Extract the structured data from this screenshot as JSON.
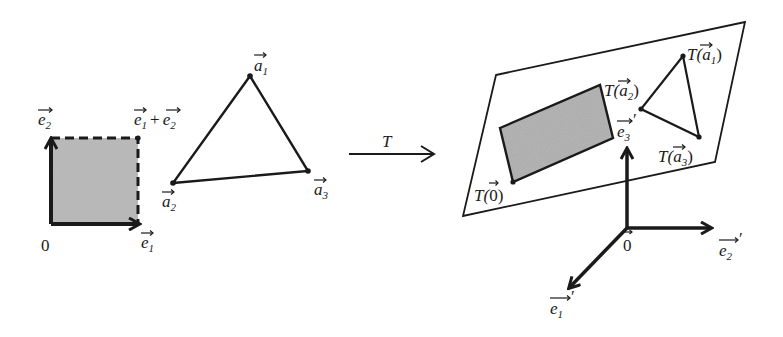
{
  "figure": {
    "left": {
      "square": {
        "origin_label": "0",
        "e1_label": "e",
        "e1_sub": "1",
        "e2_label": "e",
        "e2_sub": "2",
        "corner_label_a": "e",
        "corner_sub_a": "1",
        "corner_plus": "+",
        "corner_label_b": "e",
        "corner_sub_b": "2"
      },
      "triangle": {
        "a1_label": "a",
        "a1_sub": "1",
        "a2_label": "a",
        "a2_sub": "2",
        "a3_label": "a",
        "a3_sub": "3"
      }
    },
    "transform": {
      "label": "T"
    },
    "right": {
      "plane": {
        "t0_prefix": "T(",
        "t0_arg": "0",
        "t0_suffix": ")",
        "ta1_prefix": "T(",
        "ta1_arg": "a",
        "ta1_sub": "1",
        "ta1_suffix": ")",
        "ta2_prefix": "T(",
        "ta2_arg": "a",
        "ta2_sub": "2",
        "ta2_suffix": ")",
        "ta3_prefix": "T(",
        "ta3_arg": "a",
        "ta3_sub": "3",
        "ta3_suffix": ")"
      },
      "axes": {
        "origin_label": "0",
        "e1_label": "e",
        "e1_sub": "1",
        "e2_label": "e",
        "e2_sub": "2",
        "e3_label": "e",
        "e3_sub": "3",
        "prime": "′"
      }
    },
    "colors": {
      "ink": "#1a1a1a",
      "shade": "#a9a9a9"
    }
  }
}
